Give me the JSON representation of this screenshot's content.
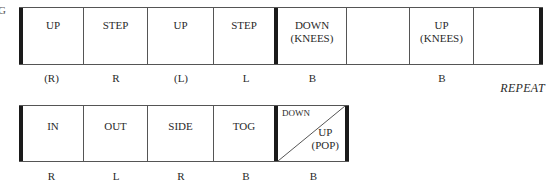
{
  "fragment_text": "G",
  "row1": {
    "cells": [
      {
        "lines": [
          "UP"
        ],
        "width": 65
      },
      {
        "lines": [
          "STEP"
        ],
        "width": 64
      },
      {
        "lines": [
          "UP"
        ],
        "width": 66
      },
      {
        "lines": [
          "STEP"
        ],
        "width": 64
      },
      {
        "lines": [
          "DOWN",
          "(KNEES)"
        ],
        "width": 69
      },
      {
        "lines": [
          ""
        ],
        "width": 63
      },
      {
        "lines": [
          "UP",
          "(KNEES)"
        ],
        "width": 64
      },
      {
        "lines": [
          ""
        ],
        "width": 69
      }
    ],
    "labels": [
      "(R)",
      "R",
      "(L)",
      "L",
      "B",
      "",
      "B",
      ""
    ],
    "repeat": "REPEAT"
  },
  "row2": {
    "cells": [
      {
        "lines": [
          "IN"
        ]
      },
      {
        "lines": [
          "OUT"
        ]
      },
      {
        "lines": [
          "SIDE"
        ]
      },
      {
        "lines": [
          "TOG"
        ]
      }
    ],
    "split_cell": {
      "top": "DOWN",
      "bottom_lines": [
        "UP",
        "(POP)"
      ]
    },
    "labels": [
      "R",
      "L",
      "R",
      "B",
      "B"
    ]
  }
}
